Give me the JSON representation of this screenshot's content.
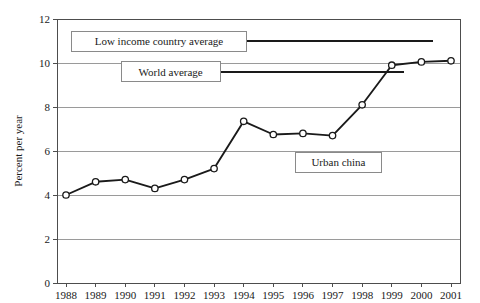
{
  "chart_data": {
    "type": "line",
    "title": "",
    "xlabel": "",
    "ylabel": "Percent per year",
    "ylim": [
      0,
      12
    ],
    "ytick_step": 2,
    "yticks": [
      "0",
      "2",
      "4",
      "6",
      "8",
      "10",
      "12"
    ],
    "grid": true,
    "legend_position": "none",
    "categories": [
      "1988",
      "1989",
      "1990",
      "1991",
      "1992",
      "1993",
      "1994",
      "1995",
      "1996",
      "1997",
      "1998",
      "1999",
      "2000",
      "2001"
    ],
    "x": [
      1988,
      1989,
      1990,
      1991,
      1992,
      1993,
      1994,
      1995,
      1996,
      1997,
      1998,
      1999,
      2000,
      2001
    ],
    "series": [
      {
        "name": "Urban china",
        "marker": "open-circle",
        "color": "#1a1a1a",
        "values": [
          4.0,
          4.6,
          4.7,
          4.3,
          4.7,
          5.2,
          7.35,
          6.75,
          6.8,
          6.7,
          8.1,
          9.9,
          10.05,
          10.1
        ]
      }
    ],
    "reference_lines": [
      {
        "name": "low-income-country-average",
        "label": "Low income country average",
        "value": 11.0,
        "x_start": 1994.1,
        "x_end": 2000.4
      },
      {
        "name": "world-average",
        "label": "World average",
        "value": 9.6,
        "x_start": 1993.2,
        "x_end": 1999.4
      }
    ],
    "annotations": [
      {
        "name": "urban-china-label",
        "label": "Urban china",
        "value": 5.5,
        "x": 1997.2
      }
    ]
  }
}
